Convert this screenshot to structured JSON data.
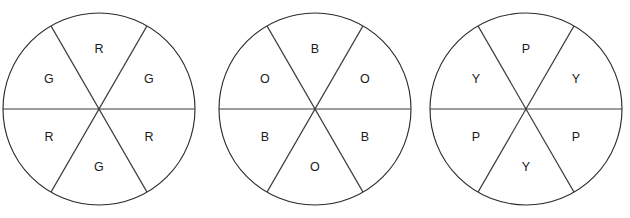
{
  "figure": {
    "title": "",
    "clipped_top_caption": "",
    "geometry": {
      "radius": 96,
      "sector_count": 6,
      "sector_angle_degrees": 60,
      "label_radius": 58,
      "stroke_color": "#2b2b2b",
      "fill_color": "#ffffff",
      "label_color": "#1a1a1a"
    }
  },
  "chart_data": {
    "type": "pie",
    "title": "",
    "xlabel": "",
    "ylabel": "",
    "legend_position": "none",
    "grid": false,
    "charts": [
      {
        "name": "spinner-1",
        "center": {
          "x": 99,
          "y": 109
        },
        "radius": 96,
        "categories": [
          "R",
          "G",
          "G",
          "R",
          "R",
          "G"
        ],
        "values": [
          60,
          60,
          60,
          60,
          60,
          60
        ],
        "slices": [
          {
            "label": "R",
            "angle_degrees": 60,
            "center_angle_degrees": 90,
            "label_x": 99,
            "label_y": 50
          },
          {
            "label": "G",
            "angle_degrees": 60,
            "center_angle_degrees": 150,
            "label_x": 49,
            "label_y": 80
          },
          {
            "label": "G",
            "angle_degrees": 60,
            "center_angle_degrees": 30,
            "label_x": 149,
            "label_y": 80
          },
          {
            "label": "R",
            "angle_degrees": 60,
            "center_angle_degrees": 210,
            "label_x": 49,
            "label_y": 138
          },
          {
            "label": "R",
            "angle_degrees": 60,
            "center_angle_degrees": 330,
            "label_x": 149,
            "label_y": 138
          },
          {
            "label": "G",
            "angle_degrees": 60,
            "center_angle_degrees": 270,
            "label_x": 99,
            "label_y": 168
          }
        ]
      },
      {
        "name": "spinner-2",
        "center": {
          "x": 315,
          "y": 109
        },
        "radius": 96,
        "categories": [
          "B",
          "O",
          "O",
          "B",
          "B",
          "O"
        ],
        "values": [
          60,
          60,
          60,
          60,
          60,
          60
        ],
        "slices": [
          {
            "label": "B",
            "angle_degrees": 60,
            "center_angle_degrees": 90,
            "label_x": 315,
            "label_y": 50
          },
          {
            "label": "O",
            "angle_degrees": 60,
            "center_angle_degrees": 150,
            "label_x": 265,
            "label_y": 80
          },
          {
            "label": "O",
            "angle_degrees": 60,
            "center_angle_degrees": 30,
            "label_x": 365,
            "label_y": 80
          },
          {
            "label": "B",
            "angle_degrees": 60,
            "center_angle_degrees": 210,
            "label_x": 265,
            "label_y": 138
          },
          {
            "label": "B",
            "angle_degrees": 60,
            "center_angle_degrees": 330,
            "label_x": 365,
            "label_y": 138
          },
          {
            "label": "O",
            "angle_degrees": 60,
            "center_angle_degrees": 270,
            "label_x": 315,
            "label_y": 168
          }
        ]
      },
      {
        "name": "spinner-3",
        "center": {
          "x": 526,
          "y": 109
        },
        "radius": 96,
        "categories": [
          "P",
          "Y",
          "Y",
          "P",
          "P",
          "Y"
        ],
        "values": [
          60,
          60,
          60,
          60,
          60,
          60
        ],
        "slices": [
          {
            "label": "P",
            "angle_degrees": 60,
            "center_angle_degrees": 90,
            "label_x": 526,
            "label_y": 50
          },
          {
            "label": "Y",
            "angle_degrees": 60,
            "center_angle_degrees": 150,
            "label_x": 476,
            "label_y": 80
          },
          {
            "label": "Y",
            "angle_degrees": 60,
            "center_angle_degrees": 30,
            "label_x": 576,
            "label_y": 80
          },
          {
            "label": "P",
            "angle_degrees": 60,
            "center_angle_degrees": 210,
            "label_x": 476,
            "label_y": 138
          },
          {
            "label": "P",
            "angle_degrees": 60,
            "center_angle_degrees": 330,
            "label_x": 576,
            "label_y": 138
          },
          {
            "label": "Y",
            "angle_degrees": 60,
            "center_angle_degrees": 270,
            "label_x": 526,
            "label_y": 168
          }
        ]
      }
    ]
  }
}
